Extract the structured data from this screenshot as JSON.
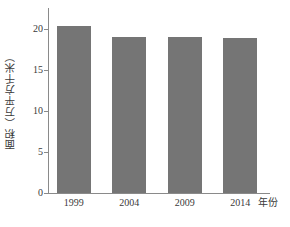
{
  "chart_data": {
    "type": "bar",
    "title": "",
    "subtitle": "",
    "categories": [
      "1999",
      "2004",
      "2009",
      "2014"
    ],
    "values": [
      20.3,
      19.0,
      19.0,
      18.9
    ],
    "xlabel": "年份",
    "ylabel": "面积（万平方千米）",
    "ylim": [
      0,
      22.5
    ],
    "yticks": [
      "0",
      "5",
      "10",
      "15",
      "20"
    ],
    "ytick_values": [
      0,
      5,
      10,
      15,
      20
    ],
    "grid": false,
    "legend": false,
    "legend_position": "none",
    "bar_color": "#757575",
    "axis_color": "#8a8a8a",
    "text_color": "#3a3a3a",
    "background": "#ffffff",
    "annotations": []
  }
}
